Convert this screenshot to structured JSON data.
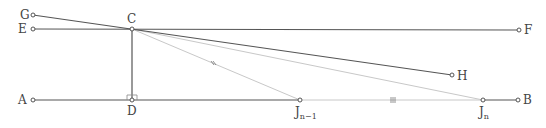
{
  "diagram": {
    "points": [
      {
        "id": "G",
        "label": "G"
      },
      {
        "id": "E",
        "label": "E"
      },
      {
        "id": "C",
        "label": "C"
      },
      {
        "id": "F",
        "label": "F"
      },
      {
        "id": "H",
        "label": "H"
      },
      {
        "id": "A",
        "label": "A"
      },
      {
        "id": "D",
        "label": "D"
      },
      {
        "id": "Jn1",
        "label": "J",
        "subscript": "n−1"
      },
      {
        "id": "Jn",
        "label": "J",
        "subscript": "n"
      },
      {
        "id": "B",
        "label": "B"
      }
    ],
    "segments": [
      {
        "from": "E",
        "to": "F",
        "style": "dark"
      },
      {
        "from": "G",
        "to": "H",
        "style": "dark"
      },
      {
        "from": "C",
        "to": "D",
        "style": "dark"
      },
      {
        "from": "A",
        "to": "Jn1",
        "style": "dark"
      },
      {
        "from": "Jn",
        "to": "B",
        "style": "dark"
      },
      {
        "from": "Jn1",
        "to": "Jn",
        "style": "light",
        "tick": "double"
      },
      {
        "from": "C",
        "to": "Jn1",
        "style": "light",
        "tick": "double"
      },
      {
        "from": "C",
        "to": "Jn",
        "style": "light"
      }
    ],
    "right_angle_at": "D"
  }
}
